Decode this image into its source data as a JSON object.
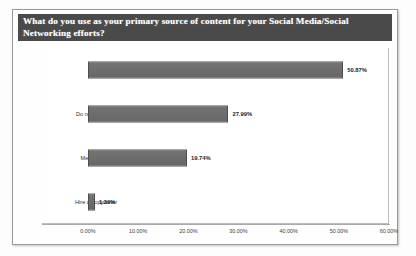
{
  "chart_data": {
    "type": "bar",
    "orientation": "horizontal",
    "title": "What do you use as your primary source of content for your Social Media/Social Networking efforts?",
    "categories": [
      "I write it",
      "Do not have one",
      "Media sources",
      "Hire a copywriter"
    ],
    "values": [
      50.87,
      27.99,
      19.74,
      1.39
    ],
    "value_labels": [
      "50.87%",
      "27.99%",
      "19.74%",
      "1.39%"
    ],
    "xlabel": "",
    "ylabel": "",
    "xlim": [
      0,
      60
    ],
    "tick_labels": [
      "0.00%",
      "10.00%",
      "20.00%",
      "30.00%",
      "40.00%",
      "50.00%",
      "60.00%"
    ],
    "tick_values": [
      0,
      10,
      20,
      30,
      40,
      50,
      60
    ],
    "grid": false,
    "legend": false,
    "bar_color": "#676767",
    "title_background": "#4a4a4a",
    "title_color": "#ffffff",
    "plot_background": "#ffffff"
  }
}
